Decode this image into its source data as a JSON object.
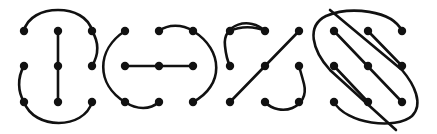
{
  "figure": {
    "colors": {
      "ink": "#111111",
      "background": "#ffffff"
    },
    "panels": [
      {
        "name": "panel-1",
        "grid_x": [
          24,
          58,
          92
        ],
        "grid_y": [
          31,
          66,
          102
        ],
        "shape": "vertical center line with outer arcs"
      },
      {
        "name": "panel-2",
        "grid_x": [
          125,
          159,
          193
        ],
        "grid_y": [
          31,
          66,
          102
        ],
        "shape": "horizontal center line with outer arcs"
      },
      {
        "name": "panel-3",
        "grid_x": [
          230,
          265,
          299
        ],
        "grid_y": [
          31,
          66,
          102
        ],
        "shape": "diagonal line with two corner arcs"
      },
      {
        "name": "panel-4",
        "grid_x": [
          334,
          368,
          402
        ],
        "grid_y": [
          31,
          66,
          102
        ],
        "shape": "three diagonal lines enclosed by S-curve"
      }
    ]
  }
}
